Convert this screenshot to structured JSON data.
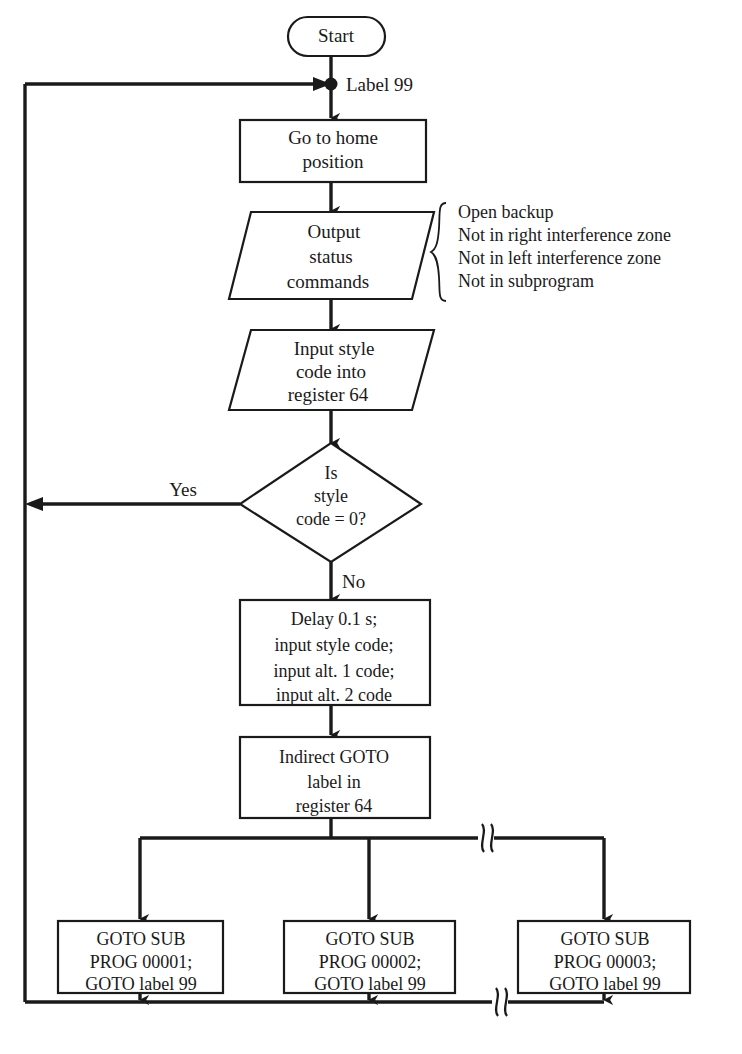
{
  "diagram": {
    "background_color": "#ffffff",
    "line_color": "#1a1a1a"
  },
  "nodes": {
    "start": {
      "shape": "terminal",
      "label": "Start"
    },
    "home": {
      "shape": "process",
      "line1": "Go to home",
      "line2": "position"
    },
    "output_status": {
      "shape": "io-parallelogram",
      "line1": "Output",
      "line2": "status",
      "line3": "commands"
    },
    "input_style": {
      "shape": "io-parallelogram",
      "line1": "Input style",
      "line2": "code into",
      "line3": "register 64"
    },
    "decision": {
      "shape": "decision",
      "line1": "Is",
      "line2": "style",
      "line3": "code = 0?"
    },
    "delay": {
      "shape": "process",
      "line1": "Delay 0.1 s;",
      "line2": "input style code;",
      "line3": "input alt. 1 code;",
      "line4": "input alt. 2 code"
    },
    "indirect_goto": {
      "shape": "process",
      "line1": "Indirect GOTO",
      "line2": "label in",
      "line3": "register 64"
    },
    "sub1": {
      "shape": "process",
      "line1": "GOTO SUB",
      "line2": "PROG 00001;",
      "line3": "GOTO label 99"
    },
    "sub2": {
      "shape": "process",
      "line1": "GOTO SUB",
      "line2": "PROG 00002;",
      "line3": "GOTO label 99"
    },
    "sub3": {
      "shape": "process",
      "line1": "GOTO SUB",
      "line2": "PROG 00003;",
      "line3": "GOTO label 99"
    }
  },
  "edge_labels": {
    "label99": "Label 99",
    "yes": "Yes",
    "no": "No"
  },
  "annotations": {
    "output_status_notes": [
      "Open backup",
      "Not in right interference zone",
      "Not in left interference zone",
      "Not in subprogram"
    ]
  }
}
